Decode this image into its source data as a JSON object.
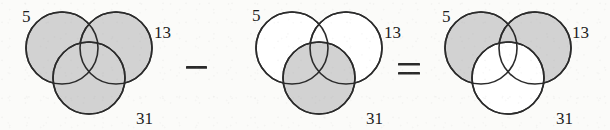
{
  "figure": {
    "type": "venn-diagram-equation",
    "background_color": "#fbfbf9",
    "stroke_color": "#2b2b2b",
    "shaded_fill": "#d2d2d2",
    "unshaded_fill": "#ffffff",
    "stroke_width": 1.6,
    "circle_radius": 36,
    "label_font_size": 17,
    "diagrams": [
      {
        "id": "diagram-1",
        "name": "minuend-venn",
        "origin_x": 62,
        "origin_y": 48,
        "circles": [
          {
            "name": "set-5",
            "cx": 62,
            "cy": 48,
            "r": 36,
            "shaded": true,
            "label": "5",
            "label_x": 22,
            "label_y": 22
          },
          {
            "name": "set-13",
            "cx": 116,
            "cy": 48,
            "r": 36,
            "shaded": true,
            "label": "13",
            "label_x": 154,
            "label_y": 38
          },
          {
            "name": "set-31",
            "cx": 89,
            "cy": 78,
            "r": 36,
            "shaded": true,
            "label": "31",
            "label_x": 136,
            "label_y": 124
          }
        ]
      },
      {
        "id": "diagram-2",
        "name": "subtrahend-venn",
        "origin_x": 292,
        "origin_y": 48,
        "circles": [
          {
            "name": "set-5",
            "cx": 292,
            "cy": 48,
            "r": 36,
            "shaded": false,
            "label": "5",
            "label_x": 252,
            "label_y": 21
          },
          {
            "name": "set-13",
            "cx": 346,
            "cy": 48,
            "r": 36,
            "shaded": false,
            "label": "13",
            "label_x": 384,
            "label_y": 38
          },
          {
            "name": "set-31",
            "cx": 319,
            "cy": 78,
            "r": 36,
            "shaded": true,
            "label": "31",
            "label_x": 366,
            "label_y": 124
          }
        ]
      },
      {
        "id": "diagram-3",
        "name": "result-venn",
        "origin_x": 481,
        "origin_y": 48,
        "circles": [
          {
            "name": "set-5",
            "cx": 481,
            "cy": 48,
            "r": 36,
            "shaded": true,
            "label": "5",
            "label_x": 442,
            "label_y": 22
          },
          {
            "name": "set-13",
            "cx": 535,
            "cy": 48,
            "r": 36,
            "shaded": true,
            "label": "13",
            "label_x": 572,
            "label_y": 38
          },
          {
            "name": "set-31",
            "cx": 508,
            "cy": 78,
            "r": 36,
            "shaded": false,
            "label": "31",
            "label_x": 556,
            "label_y": 124
          }
        ]
      }
    ],
    "operators": [
      {
        "name": "minus-operator",
        "symbol": "−",
        "x": 196,
        "y": 68
      },
      {
        "name": "equals-operator",
        "symbol": "=",
        "x": 409,
        "y": 70
      }
    ],
    "labels": {
      "five": "5",
      "thirteen": "13",
      "thirtyone": "31"
    }
  }
}
